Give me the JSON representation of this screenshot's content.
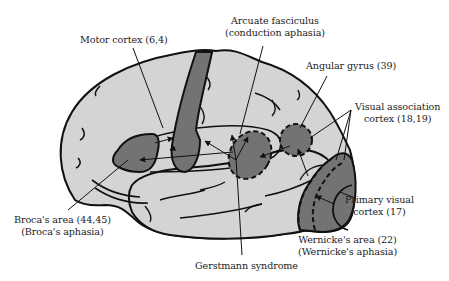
{
  "diagram": {
    "colors": {
      "brain_fill": "#d4d4d4",
      "region_fill": "#737373",
      "outline": "#111111",
      "background": "#ffffff",
      "text": "#222222"
    },
    "labels": {
      "motor_cortex": {
        "line1": "Motor cortex (6,4)"
      },
      "arcuate": {
        "line1": "Arcuate fasciculus",
        "line2": "(conduction aphasia)"
      },
      "angular_gyrus": {
        "line1": "Angular gyrus (39)"
      },
      "visual_association": {
        "line1": "Visual association",
        "line2": "cortex (18,19)"
      },
      "broca": {
        "line1": "Broca's area (44,45)",
        "line2": "(Broca's aphasia)"
      },
      "primary_visual": {
        "line1": "Primary visual",
        "line2": "cortex (17)"
      },
      "wernicke": {
        "line1": "Wernicke's area (22)",
        "line2": "(Wernicke's aphasia)"
      },
      "gerstmann": {
        "line1": "Gerstmann syndrome"
      }
    },
    "regions": [
      {
        "name": "motor-cortex",
        "brodmann": "6,4"
      },
      {
        "name": "brocas-area",
        "brodmann": "44,45"
      },
      {
        "name": "arcuate-fasciculus"
      },
      {
        "name": "angular-gyrus",
        "brodmann": "39"
      },
      {
        "name": "wernickes-area",
        "brodmann": "22"
      },
      {
        "name": "visual-association-cortex",
        "brodmann": "18,19"
      },
      {
        "name": "primary-visual-cortex",
        "brodmann": "17"
      }
    ]
  }
}
